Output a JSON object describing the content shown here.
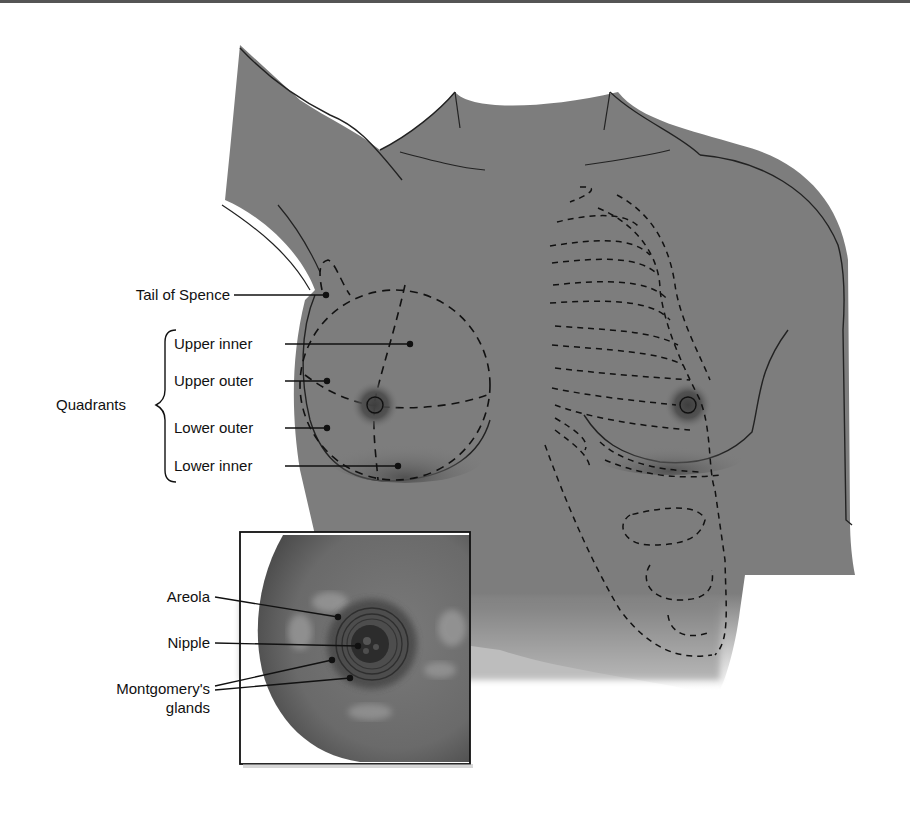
{
  "figure": {
    "labels": {
      "tail_of_spence": "Tail of Spence",
      "quadrants": "Quadrants",
      "upper_inner": "Upper inner",
      "upper_outer": "Upper outer",
      "lower_outer": "Lower outer",
      "lower_inner": "Lower inner",
      "areola": "Areola",
      "nipple": "Nipple",
      "montgomery_line1": "Montgomery's",
      "montgomery_line2": "glands"
    },
    "colors": {
      "skin": "#7d7d7d",
      "skin_dark": "#5a5a5a",
      "line": "#111111",
      "background": "#ffffff"
    }
  }
}
